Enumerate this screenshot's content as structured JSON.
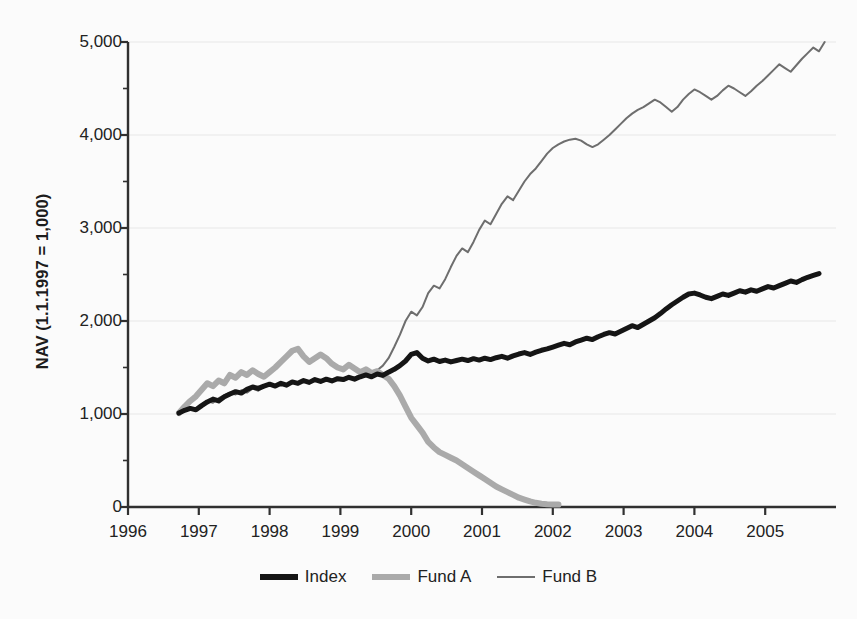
{
  "chart_data": {
    "type": "line",
    "title": "",
    "xlabel": "",
    "ylabel": "NAV (1.1.1997 = 1,000)",
    "xlim": [
      1996.0,
      2006.0
    ],
    "ylim": [
      0,
      5000
    ],
    "yticks": [
      0,
      1000,
      2000,
      3000,
      4000,
      5000
    ],
    "ytick_labels": [
      "0",
      "1,000",
      "2,000",
      "3,000",
      "4,000",
      "5,000"
    ],
    "xticks": [
      1996,
      1997,
      1998,
      1999,
      2000,
      2001,
      2002,
      2003,
      2004,
      2005
    ],
    "xtick_labels": [
      "1996",
      "1997",
      "1998",
      "1999",
      "2000",
      "2001",
      "2002",
      "2003",
      "2004",
      "2005"
    ],
    "y_minor_ticks": [
      500,
      1500,
      2500,
      3500,
      4500
    ],
    "grid": "horizontal-major-only",
    "legend_position": "bottom-center",
    "legend": [
      "Index",
      "Fund A",
      "Fund B"
    ],
    "colors": {
      "index": "#151515",
      "fund_a": "#aaaaaa",
      "fund_b": "#6e6e6e",
      "grid": "#e8e8e8",
      "axis": "#303030",
      "background": "#fbfbfb"
    },
    "series": [
      {
        "name": "Index",
        "color": "#151515",
        "width": 5,
        "x": [
          1996.72,
          1996.8,
          1996.88,
          1996.96,
          1997.04,
          1997.12,
          1997.2,
          1997.28,
          1997.36,
          1997.44,
          1997.52,
          1997.6,
          1997.68,
          1997.76,
          1997.84,
          1997.92,
          1998.0,
          1998.08,
          1998.16,
          1998.24,
          1998.32,
          1998.4,
          1998.48,
          1998.56,
          1998.64,
          1998.72,
          1998.8,
          1998.88,
          1998.96,
          1999.04,
          1999.12,
          1999.2,
          1999.28,
          1999.36,
          1999.44,
          1999.52,
          1999.6,
          1999.68,
          1999.76,
          1999.84,
          1999.92,
          2000.0,
          2000.08,
          2000.16,
          2000.24,
          2000.32,
          2000.4,
          2000.48,
          2000.56,
          2000.64,
          2000.72,
          2000.8,
          2000.88,
          2000.96,
          2001.04,
          2001.12,
          2001.2,
          2001.28,
          2001.36,
          2001.44,
          2001.52,
          2001.6,
          2001.68,
          2001.76,
          2001.84,
          2001.92,
          2002.0,
          2002.08,
          2002.16,
          2002.24,
          2002.32,
          2002.4,
          2002.48,
          2002.56,
          2002.64,
          2002.72,
          2002.8,
          2002.88,
          2002.96,
          2003.04,
          2003.12,
          2003.2,
          2003.28,
          2003.36,
          2003.44,
          2003.52,
          2003.6,
          2003.68,
          2003.76,
          2003.84,
          2003.92,
          2004.0,
          2004.08,
          2004.16,
          2004.24,
          2004.32,
          2004.4,
          2004.48,
          2004.56,
          2004.64,
          2004.72,
          2004.8,
          2004.88,
          2004.96,
          2005.04,
          2005.12,
          2005.2,
          2005.28,
          2005.36,
          2005.44,
          2005.52,
          2005.6,
          2005.68,
          2005.76
        ],
        "y": [
          1010,
          1040,
          1060,
          1045,
          1090,
          1130,
          1160,
          1140,
          1185,
          1215,
          1240,
          1225,
          1265,
          1290,
          1275,
          1300,
          1320,
          1300,
          1330,
          1310,
          1345,
          1330,
          1360,
          1340,
          1370,
          1350,
          1375,
          1355,
          1380,
          1370,
          1395,
          1375,
          1400,
          1420,
          1400,
          1430,
          1415,
          1450,
          1480,
          1520,
          1570,
          1640,
          1660,
          1600,
          1570,
          1590,
          1565,
          1580,
          1560,
          1575,
          1590,
          1575,
          1595,
          1580,
          1600,
          1585,
          1605,
          1620,
          1600,
          1625,
          1645,
          1660,
          1640,
          1665,
          1685,
          1700,
          1720,
          1740,
          1760,
          1745,
          1775,
          1795,
          1815,
          1800,
          1830,
          1855,
          1875,
          1860,
          1890,
          1920,
          1950,
          1930,
          1965,
          2000,
          2035,
          2080,
          2130,
          2175,
          2215,
          2255,
          2290,
          2300,
          2280,
          2255,
          2240,
          2265,
          2290,
          2275,
          2300,
          2325,
          2310,
          2335,
          2320,
          2345,
          2370,
          2355,
          2380,
          2405,
          2430,
          2415,
          2445,
          2470,
          2490,
          2510
        ]
      },
      {
        "name": "Fund A",
        "color": "#aaaaaa",
        "width": 6,
        "x": [
          1996.72,
          1996.8,
          1996.88,
          1996.96,
          1997.04,
          1997.12,
          1997.2,
          1997.28,
          1997.36,
          1997.44,
          1997.52,
          1997.6,
          1997.68,
          1997.76,
          1997.84,
          1997.92,
          1998.0,
          1998.08,
          1998.16,
          1998.24,
          1998.32,
          1998.4,
          1998.48,
          1998.56,
          1998.64,
          1998.72,
          1998.8,
          1998.88,
          1998.96,
          1999.04,
          1999.12,
          1999.2,
          1999.28,
          1999.36,
          1999.44,
          1999.52,
          1999.6,
          1999.68,
          1999.76,
          1999.84,
          1999.92,
          2000.0,
          2000.08,
          2000.16,
          2000.24,
          2000.32,
          2000.4,
          2000.48,
          2000.56,
          2000.64,
          2000.72,
          2000.8,
          2000.88,
          2000.96,
          2001.04,
          2001.12,
          2001.2,
          2001.28,
          2001.36,
          2001.44,
          2001.52,
          2001.6,
          2001.68,
          2001.76,
          2001.84,
          2001.92,
          2002.0,
          2002.08
        ],
        "y": [
          1010,
          1080,
          1140,
          1190,
          1260,
          1330,
          1300,
          1360,
          1330,
          1420,
          1390,
          1450,
          1420,
          1470,
          1430,
          1400,
          1450,
          1500,
          1560,
          1620,
          1680,
          1700,
          1620,
          1560,
          1600,
          1640,
          1600,
          1540,
          1500,
          1480,
          1530,
          1490,
          1450,
          1480,
          1440,
          1460,
          1420,
          1380,
          1300,
          1200,
          1080,
          960,
          880,
          800,
          700,
          640,
          590,
          560,
          530,
          500,
          460,
          420,
          380,
          340,
          300,
          260,
          220,
          190,
          160,
          130,
          100,
          80,
          60,
          45,
          35,
          30,
          28,
          26
        ]
      },
      {
        "name": "Fund B",
        "color": "#6e6e6e",
        "width": 2,
        "x": [
          1996.72,
          1996.8,
          1996.88,
          1996.96,
          1997.04,
          1997.12,
          1997.2,
          1997.28,
          1997.36,
          1997.44,
          1997.52,
          1997.6,
          1997.68,
          1997.76,
          1997.84,
          1997.92,
          1998.0,
          1998.08,
          1998.16,
          1998.24,
          1998.32,
          1998.4,
          1998.48,
          1998.56,
          1998.64,
          1998.72,
          1998.8,
          1998.88,
          1998.96,
          1999.04,
          1999.12,
          1999.2,
          1999.28,
          1999.36,
          1999.44,
          1999.52,
          1999.6,
          1999.68,
          1999.76,
          1999.84,
          1999.92,
          2000.0,
          2000.08,
          2000.16,
          2000.24,
          2000.32,
          2000.4,
          2000.48,
          2000.56,
          2000.64,
          2000.72,
          2000.8,
          2000.88,
          2000.96,
          2001.04,
          2001.12,
          2001.2,
          2001.28,
          2001.36,
          2001.44,
          2001.52,
          2001.6,
          2001.68,
          2001.76,
          2001.84,
          2001.92,
          2002.0,
          2002.08,
          2002.16,
          2002.24,
          2002.32,
          2002.4,
          2002.48,
          2002.56,
          2002.64,
          2002.72,
          2002.8,
          2002.88,
          2002.96,
          2003.04,
          2003.12,
          2003.2,
          2003.28,
          2003.36,
          2003.44,
          2003.52,
          2003.6,
          2003.68,
          2003.76,
          2003.84,
          2003.92,
          2004.0,
          2004.08,
          2004.16,
          2004.24,
          2004.32,
          2004.4,
          2004.48,
          2004.56,
          2004.64,
          2004.72,
          2004.8,
          2004.88,
          2004.96,
          2005.04,
          2005.12,
          2005.2,
          2005.28,
          2005.36,
          2005.44,
          2005.52,
          2005.6,
          2005.68,
          2005.76,
          2005.84
        ],
        "y": [
          1010,
          1030,
          1060,
          1050,
          1100,
          1140,
          1120,
          1170,
          1200,
          1230,
          1210,
          1255,
          1230,
          1275,
          1250,
          1290,
          1310,
          1290,
          1320,
          1300,
          1340,
          1320,
          1355,
          1335,
          1365,
          1345,
          1375,
          1360,
          1390,
          1370,
          1400,
          1390,
          1420,
          1450,
          1430,
          1470,
          1520,
          1600,
          1720,
          1850,
          2000,
          2100,
          2060,
          2150,
          2300,
          2380,
          2350,
          2450,
          2580,
          2700,
          2780,
          2740,
          2850,
          2980,
          3080,
          3040,
          3150,
          3260,
          3340,
          3300,
          3400,
          3500,
          3580,
          3640,
          3720,
          3800,
          3860,
          3900,
          3930,
          3950,
          3960,
          3940,
          3900,
          3870,
          3900,
          3950,
          4000,
          4060,
          4120,
          4180,
          4230,
          4270,
          4300,
          4340,
          4380,
          4350,
          4300,
          4250,
          4300,
          4380,
          4440,
          4490,
          4460,
          4420,
          4380,
          4420,
          4480,
          4530,
          4500,
          4460,
          4420,
          4470,
          4530,
          4580,
          4640,
          4700,
          4760,
          4720,
          4680,
          4750,
          4820,
          4880,
          4940,
          4900,
          5000
        ]
      }
    ]
  },
  "axis": {
    "y_title": "NAV (1.1.1997 = 1,000)"
  },
  "legend": {
    "items": [
      {
        "label": "Index",
        "style": "index"
      },
      {
        "label": "Fund A",
        "style": "funda"
      },
      {
        "label": "Fund B",
        "style": "fundb"
      }
    ]
  }
}
